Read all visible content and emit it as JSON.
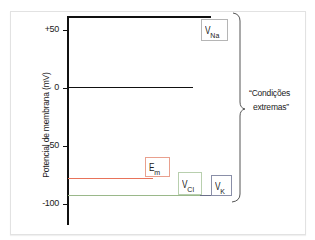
{
  "diagram": {
    "y_axis": {
      "label": "Potencial de membrana (mV)",
      "ticks": [
        {
          "label": "+50",
          "value": 50
        },
        {
          "label": "0",
          "value": 0
        },
        {
          "label": "-50",
          "value": -50
        },
        {
          "label": "-100",
          "value": -100
        }
      ]
    },
    "levels": [
      {
        "name": "V",
        "subscript": "Na",
        "value": 60,
        "color": "#111111"
      },
      {
        "name": "zero-line",
        "value": 0,
        "color": "#111111"
      },
      {
        "name": "E",
        "subscript": "m",
        "value": -77,
        "color": "#e8735a"
      },
      {
        "name": "V",
        "subscript": "Cl",
        "value": -92,
        "color": "#9ab88a"
      },
      {
        "name": "V",
        "subscript": "K",
        "value": -92,
        "color": "#555577"
      }
    ],
    "labels": {
      "na": {
        "main": "V",
        "sub": "Na"
      },
      "em": {
        "main": "E",
        "sub": "m"
      },
      "cl": {
        "main": "V",
        "sub": "Cl"
      },
      "k": {
        "main": "V",
        "sub": "K"
      }
    },
    "brace_annotation": {
      "line1": "“Condições",
      "line2": "extremas”"
    },
    "colors": {
      "em_line": "#e8735a",
      "em_box_border": "#e9a08e",
      "cl_line": "#9ab88a",
      "cl_box_border": "#b8cfae",
      "k_box_border": "#8a8fa8",
      "na_box_border": "#b5b5b5",
      "axis": "#111111"
    }
  }
}
